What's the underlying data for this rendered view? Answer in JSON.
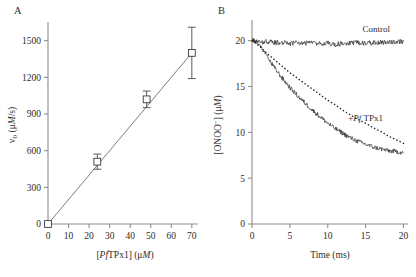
{
  "figure": {
    "panelA_letter": "A",
    "panelB_letter": "B"
  },
  "chart_data": [
    {
      "type": "scatter",
      "panel": "A",
      "title": "",
      "xlabel_parts": {
        "pre": "[",
        "italic": "Pf",
        "post": "TPx1] (",
        "unit_italic": "M",
        "unit_pre": "μ",
        "close": ")"
      },
      "xlabel": "[PfTPx1] (μM)",
      "ylabel": "v0 (μM/s)",
      "ylabel_parts": {
        "v": "v",
        "sub": "0",
        "open": " (",
        "mu": "μ",
        "M": "M",
        "close": "/s)"
      },
      "xlim": [
        0,
        73
      ],
      "ylim": [
        0,
        1620
      ],
      "xticks": [
        0,
        10,
        20,
        30,
        40,
        50,
        60,
        70
      ],
      "yticks": [
        0,
        300,
        600,
        900,
        1200,
        1500
      ],
      "grid": false,
      "legend": "none",
      "marker": "open-square",
      "x": [
        0,
        24,
        48,
        70
      ],
      "y": [
        0,
        510,
        1020,
        1400
      ],
      "yerr": [
        0,
        62,
        68,
        210
      ],
      "fit_line": {
        "x": [
          0,
          70
        ],
        "y": [
          0,
          1400
        ],
        "slope": 20.0,
        "intercept": 0
      }
    },
    {
      "type": "line",
      "panel": "B",
      "title": "",
      "xlabel": "Time (ms)",
      "ylabel": "[ONOO−] (μM)",
      "ylabel_parts": {
        "pre": "[ONOO",
        "sup": "−",
        "post": "] (",
        "mu": "μ",
        "M": "M",
        "close": ")"
      },
      "xlim": [
        0,
        20.6
      ],
      "ylim": [
        0,
        21.6
      ],
      "xticks": [
        0,
        5,
        10,
        15,
        20
      ],
      "yticks": [
        0,
        5,
        10,
        15,
        20
      ],
      "grid": false,
      "legend": "inline-annotations",
      "annotations": [
        {
          "text": "Control",
          "x": 16.4,
          "y": 21.0
        },
        {
          "text": "+PfTPx1",
          "x": 15.0,
          "y": 11.2,
          "italic_part": "Pf"
        }
      ],
      "series": [
        {
          "name": "Control",
          "style": "noisy-solid",
          "x": [
            0,
            0.5,
            1,
            1.5,
            2,
            3,
            4,
            5,
            6,
            7,
            8,
            9,
            10,
            11,
            12,
            13,
            14,
            15,
            16,
            17,
            18,
            19,
            20
          ],
          "values": [
            20.0,
            19.9,
            20.0,
            19.8,
            19.9,
            19.8,
            19.8,
            19.7,
            19.8,
            19.7,
            19.8,
            19.7,
            19.7,
            19.6,
            19.7,
            19.7,
            19.8,
            19.7,
            19.8,
            19.8,
            19.9,
            19.9,
            19.9
          ],
          "noise": 0.28
        },
        {
          "name": "+PfTPx1 measured",
          "style": "noisy-solid",
          "x": [
            0,
            0.5,
            1,
            1.5,
            2,
            2.5,
            3,
            4,
            5,
            6,
            7,
            8,
            9,
            10,
            11,
            12,
            13,
            14,
            15,
            16,
            17,
            18,
            19,
            20
          ],
          "values": [
            20.0,
            19.9,
            19.6,
            18.9,
            18.2,
            17.6,
            17.0,
            15.9,
            14.9,
            14.0,
            13.2,
            12.4,
            11.7,
            11.0,
            10.4,
            9.9,
            9.4,
            9.0,
            8.7,
            8.4,
            8.2,
            8.0,
            7.9,
            7.8
          ],
          "noise": 0.26
        },
        {
          "name": "+PfTPx1 fit",
          "style": "dotted",
          "x": [
            0,
            1,
            2,
            3,
            4,
            5,
            6,
            7,
            8,
            9,
            10,
            11,
            12,
            13,
            14,
            15,
            16,
            17,
            18,
            19,
            20
          ],
          "values": [
            20.0,
            19.4,
            18.6,
            17.9,
            17.2,
            16.5,
            15.9,
            15.3,
            14.7,
            14.1,
            13.5,
            13.0,
            12.4,
            11.9,
            11.4,
            11.0,
            10.5,
            10.1,
            9.6,
            9.2,
            8.8
          ],
          "noise": 0
        }
      ]
    }
  ]
}
